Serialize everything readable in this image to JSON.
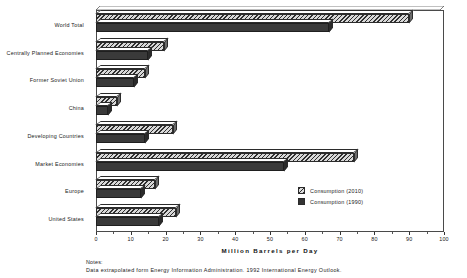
{
  "chart_data": {
    "type": "bar",
    "orientation": "horizontal",
    "title": "",
    "xlabel": "Million  Barrels  per  Day",
    "ylabel": "",
    "xlim": [
      0,
      100
    ],
    "xticks": [
      0,
      10,
      20,
      30,
      40,
      50,
      60,
      70,
      80,
      90,
      100
    ],
    "xticklabels": [
      "0",
      "10",
      "20",
      "30",
      "40",
      "50",
      "60",
      "70",
      "80",
      "90",
      "100"
    ],
    "minor_tick_step": 5,
    "grid": false,
    "legend_position": "center-right-inside",
    "categories": [
      "World Total",
      "Centrally Planned Economies",
      "Former Soviet Union",
      "China",
      "Developing Countries",
      "Market Economies",
      "Europe",
      "United States"
    ],
    "series": [
      {
        "name": "Consumption  (2010)",
        "style": "hatched",
        "values": [
          90,
          19.5,
          14,
          6,
          22,
          74,
          17,
          23
        ]
      },
      {
        "name": "Consumption  (1990)",
        "style": "solid-dark",
        "values": [
          67,
          15,
          11,
          3.5,
          14,
          54,
          13,
          18
        ]
      }
    ]
  },
  "legend": {
    "items": [
      {
        "label": "Consumption  (2010)",
        "swatch": "hatched-swatch"
      },
      {
        "label": "Consumption  (1990)",
        "swatch": "solid-dark-swatch"
      }
    ]
  },
  "notes": {
    "heading": "Notes:",
    "body": "Data  extrapolated  form  Energy  Information  Administration.  1992  International  Energy  Outlook."
  },
  "colors": {
    "series_2010_hatch": "#2f2f2f",
    "series_2010_fill": "#d8d8d8",
    "series_1990_fill": "#3a3a3a",
    "frame": "#4a4a4a",
    "text": "#1a1a1a",
    "background": "#ffffff"
  }
}
